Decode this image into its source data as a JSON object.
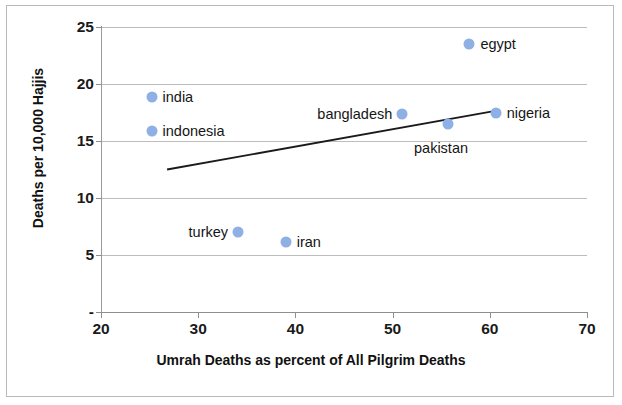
{
  "chart_data": {
    "type": "scatter",
    "title": "",
    "xlabel": "Umrah Deaths as percent of All Pilgrim Deaths",
    "ylabel": "Deaths per 10,000 Hajjis",
    "xlim": [
      20,
      70
    ],
    "ylim": [
      0,
      25
    ],
    "xticks": [
      "20",
      "30",
      "40",
      "50",
      "60",
      "70"
    ],
    "xtick_values": [
      20,
      30,
      40,
      50,
      60,
      70
    ],
    "yticks": [
      "-",
      "5",
      "10",
      "15",
      "20",
      "25"
    ],
    "ytick_values": [
      0,
      5,
      10,
      15,
      20,
      25
    ],
    "grid": "horizontal",
    "legend": "none",
    "marker_color": "#8fb0e4",
    "trendline_color": "#1a1a1a",
    "points": [
      {
        "label": "india",
        "x": 25.2,
        "y": 18.9,
        "label_side": "right"
      },
      {
        "label": "indonesia",
        "x": 25.2,
        "y": 15.9,
        "label_side": "right"
      },
      {
        "label": "turkey",
        "x": 34.1,
        "y": 7.0,
        "label_side": "left"
      },
      {
        "label": "iran",
        "x": 39.0,
        "y": 6.1,
        "label_side": "right"
      },
      {
        "label": "bangladesh",
        "x": 51.0,
        "y": 17.4,
        "label_side": "left"
      },
      {
        "label": "pakistan",
        "x": 55.7,
        "y": 16.5,
        "label_side": "below"
      },
      {
        "label": "egypt",
        "x": 57.9,
        "y": 23.5,
        "label_side": "right"
      },
      {
        "label": "nigeria",
        "x": 60.6,
        "y": 17.5,
        "label_side": "right"
      }
    ],
    "trendline": {
      "x0": 26.8,
      "y0": 12.5,
      "x1": 61.0,
      "y1": 17.7
    }
  }
}
